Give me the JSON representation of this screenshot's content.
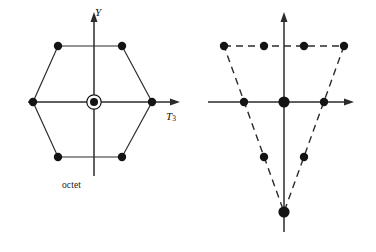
{
  "figure": {
    "background": "#ffffff",
    "ink": "#1a1a1a",
    "width": 376,
    "height": 252
  },
  "octet": {
    "caption": "octet",
    "axes": {
      "y_label": "Y",
      "t3_label": "T",
      "t3_sub": "3",
      "origin": [
        94,
        102
      ],
      "x_range": [
        28,
        176
      ],
      "y_range": [
        14,
        176
      ],
      "arrows": [
        "up",
        "right"
      ]
    },
    "outline_style": "solid",
    "points": [
      {
        "id": "p1",
        "x": 58,
        "y": 46,
        "label": "upper-left",
        "marker": "filled",
        "multiplicity": 1
      },
      {
        "id": "p2",
        "x": 122,
        "y": 46,
        "label": "upper-right",
        "marker": "filled",
        "multiplicity": 1
      },
      {
        "id": "p3",
        "x": 152,
        "y": 102,
        "label": "right",
        "marker": "filled",
        "multiplicity": 1
      },
      {
        "id": "p4",
        "x": 122,
        "y": 157,
        "label": "lower-right",
        "marker": "filled",
        "multiplicity": 1
      },
      {
        "id": "p5",
        "x": 58,
        "y": 157,
        "label": "lower-left",
        "marker": "filled",
        "multiplicity": 1
      },
      {
        "id": "p6",
        "x": 33,
        "y": 102,
        "label": "left",
        "marker": "filled",
        "multiplicity": 1
      },
      {
        "id": "p7",
        "x": 94,
        "y": 102,
        "label": "center",
        "marker": "filled-ringed",
        "multiplicity": 2
      }
    ],
    "state_count": 8
  },
  "decuplet": {
    "caption": "decuplet",
    "axes": {
      "y_label": "Y",
      "t3_label": "T",
      "t3_sub": "3",
      "origin": [
        96,
        102
      ],
      "x_range": [
        26,
        170
      ],
      "y_range": [
        14,
        232
      ],
      "arrows": [
        "up",
        "right"
      ]
    },
    "outline_style": "dashed",
    "points": [
      {
        "id": "d1",
        "x": 36,
        "y": 46,
        "label": "top-row-1",
        "marker": "filled",
        "multiplicity": 1
      },
      {
        "id": "d2",
        "x": 76,
        "y": 46,
        "label": "top-row-2",
        "marker": "filled",
        "multiplicity": 1
      },
      {
        "id": "d3",
        "x": 116,
        "y": 46,
        "label": "top-row-3",
        "marker": "filled",
        "multiplicity": 1
      },
      {
        "id": "d4",
        "x": 156,
        "y": 46,
        "label": "top-row-4",
        "marker": "filled",
        "multiplicity": 1
      },
      {
        "id": "d5",
        "x": 56,
        "y": 102,
        "label": "mid-row-1",
        "marker": "filled",
        "multiplicity": 1
      },
      {
        "id": "d6",
        "x": 96,
        "y": 102,
        "label": "mid-row-2-origin",
        "marker": "filled-large",
        "multiplicity": 1
      },
      {
        "id": "d7",
        "x": 136,
        "y": 102,
        "label": "mid-row-3",
        "marker": "filled",
        "multiplicity": 1
      },
      {
        "id": "d8",
        "x": 76,
        "y": 157,
        "label": "low-row-1",
        "marker": "filled",
        "multiplicity": 1
      },
      {
        "id": "d9",
        "x": 116,
        "y": 157,
        "label": "low-row-2",
        "marker": "filled",
        "multiplicity": 1
      },
      {
        "id": "d10",
        "x": 96,
        "y": 212,
        "label": "apex-bottom",
        "marker": "filled-large",
        "multiplicity": 1
      }
    ],
    "state_count": 10
  }
}
